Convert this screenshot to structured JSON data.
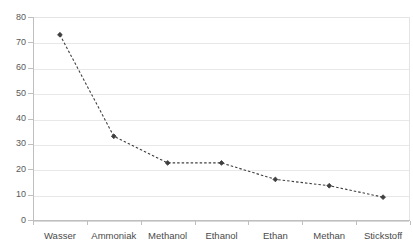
{
  "chart_data": {
    "type": "line",
    "title": "",
    "subtitle": "",
    "xlabel": "",
    "ylabel": "",
    "categories": [
      "Wasser",
      "Ammoniak",
      "Methanol",
      "Ethanol",
      "Ethan",
      "Methan",
      "Stickstoff"
    ],
    "series": [
      {
        "name": "",
        "values": [
          73,
          33,
          22.5,
          22.5,
          16,
          13.5,
          9
        ]
      }
    ],
    "ylim": [
      0,
      80
    ],
    "ytick_values": [
      0,
      10,
      20,
      30,
      40,
      50,
      60,
      70,
      80
    ],
    "ytick_labels": [
      "0",
      "10",
      "20",
      "30",
      "40",
      "50",
      "60",
      "70",
      "80"
    ],
    "grid": true,
    "grid_axis": "y",
    "legend": false,
    "legend_position": "none",
    "line_style": "dashed",
    "marker": "diamond",
    "annotations": []
  },
  "style": {
    "line_color": "#404040",
    "marker_color": "#3f3f3f",
    "grid_color": "#e8e8e8",
    "axis_color": "#bfbfbf",
    "tick_label_color": "#595959",
    "category_label_color": "#4a4a4a",
    "background": "#ffffff"
  }
}
